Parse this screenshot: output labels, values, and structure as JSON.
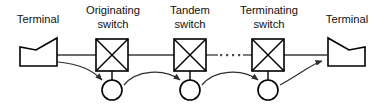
{
  "diagram": {
    "type": "network-flow-diagram",
    "colors": {
      "outline": "#000000",
      "link": "#3a3a3a",
      "arrow": "#2e2e2e",
      "text": "#111111",
      "background": "#ffffff"
    },
    "labels": {
      "terminal_left": "Terminal",
      "originating_switch_line1": "Originating",
      "originating_switch_line2": "switch",
      "tandem_switch_line1": "Tandem",
      "tandem_switch_line2": "switch",
      "terminating_switch_line1": "Terminating",
      "terminating_switch_line2": "switch",
      "terminal_right": "Terminal"
    },
    "nodes": [
      {
        "id": "terminal-left",
        "kind": "terminal",
        "label": "Terminal",
        "x": 38,
        "y": 55
      },
      {
        "id": "originating-switch",
        "kind": "switch",
        "label": "Originating switch",
        "x": 112,
        "y": 52
      },
      {
        "id": "tandem-switch",
        "kind": "switch",
        "label": "Tandem switch",
        "x": 190,
        "y": 52
      },
      {
        "id": "terminating-switch",
        "kind": "switch",
        "label": "Terminating switch",
        "x": 268,
        "y": 52
      },
      {
        "id": "terminal-right",
        "kind": "terminal",
        "label": "Terminal",
        "x": 345,
        "y": 55
      }
    ],
    "attached_circles": [
      {
        "id": "circle-originating",
        "x": 112,
        "y": 90,
        "r": 10
      },
      {
        "id": "circle-tandem",
        "x": 190,
        "y": 90,
        "r": 10
      },
      {
        "id": "circle-terminating",
        "x": 268,
        "y": 90,
        "r": 10
      }
    ],
    "ellipsis": {
      "between": [
        "tandem-switch",
        "terminating-switch"
      ],
      "dot_count": 4
    },
    "flow_arrows": [
      {
        "id": "arrow-1",
        "from": "terminal-left",
        "to": "circle-originating"
      },
      {
        "id": "arrow-2",
        "from": "circle-originating",
        "to": "circle-tandem"
      },
      {
        "id": "arrow-3",
        "from": "circle-tandem",
        "to": "circle-terminating"
      },
      {
        "id": "arrow-4",
        "from": "circle-terminating",
        "to": "terminal-right"
      }
    ]
  }
}
